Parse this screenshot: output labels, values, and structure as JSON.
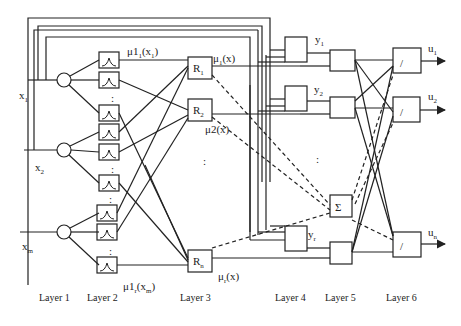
{
  "diagram": {
    "type": "fuzzy neural network architecture",
    "inputs": [
      {
        "name": "x",
        "sub": "1"
      },
      {
        "name": "x",
        "sub": "2"
      },
      {
        "name": "x",
        "sub": "m"
      }
    ],
    "membership_labels": {
      "top": {
        "pre": "μ1",
        "sub": "1",
        "post": "(x",
        "post_sub": "1",
        "end": ")"
      },
      "bottom": {
        "pre": "μ1",
        "sub": "r",
        "post": "(x",
        "post_sub": "m",
        "end": ")"
      }
    },
    "rules": [
      {
        "name": "R",
        "sub": "1"
      },
      {
        "name": "R",
        "sub": "2"
      },
      {
        "name": "R",
        "sub": "n"
      }
    ],
    "rule_outputs": [
      {
        "pre": "μ",
        "sub": "1",
        "post": "(x)"
      },
      {
        "pre": "μ2(x)",
        "sub": "",
        "post": ""
      },
      {
        "pre": "μ",
        "sub": "r",
        "post": "(x)"
      }
    ],
    "layer4_outputs": [
      {
        "name": "y",
        "sub": "1"
      },
      {
        "name": "y",
        "sub": "2"
      },
      {
        "name": "y",
        "sub": "r"
      }
    ],
    "sum_symbol": "Σ",
    "divide_symbol": "/",
    "outputs": [
      {
        "name": "u",
        "sub": "1"
      },
      {
        "name": "u",
        "sub": "2"
      },
      {
        "name": "u",
        "sub": "n"
      }
    ],
    "ellipsis": ":",
    "layers": [
      "Layer 1",
      "Layer 2",
      "Layer 3",
      "Layer 4",
      "Layer 5",
      "Layer 6"
    ]
  }
}
